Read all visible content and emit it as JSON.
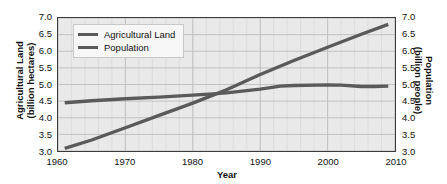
{
  "chart_data": {
    "type": "line",
    "title": "",
    "xlabel": "Year",
    "ylabel": "Agricultural Land\n(billion hectares)",
    "ylabel_left_line1": "Agricultural Land",
    "ylabel_left_line2": "(billion hectares)",
    "ylabel_right_line1": "Population",
    "ylabel_right_line2": "(billion people)",
    "xlim": [
      1960,
      2010
    ],
    "ylim": [
      3.0,
      7.0
    ],
    "ylim_right": [
      3.0,
      7.0
    ],
    "grid": true,
    "legend_position": "top-left",
    "xticks": [
      "1960",
      "1970",
      "1980",
      "1990",
      "2000",
      "2010"
    ],
    "xtick_values": [
      1960,
      1970,
      1980,
      1990,
      2000,
      2010
    ],
    "yticks": [
      "7.0",
      "6.5",
      "6.0",
      "5.5",
      "5.0",
      "4.5",
      "4.0",
      "3.5",
      "3.0"
    ],
    "ytick_values": [
      7.0,
      6.5,
      6.0,
      5.5,
      5.0,
      4.5,
      4.0,
      3.5,
      3.0
    ],
    "yticks_right": [
      "7.0",
      "6.5",
      "6.0",
      "5.5",
      "5.0",
      "4.5",
      "4.0",
      "3.5",
      "3.0"
    ],
    "ytick_right_values": [
      7.0,
      6.5,
      6.0,
      5.5,
      5.0,
      4.5,
      4.0,
      3.5,
      3.0
    ],
    "series": [
      {
        "name": "Agricultural Land",
        "axis": "left",
        "unit": "billion hectares",
        "color": "#5a5a5a",
        "x": [
          1961,
          1965,
          1970,
          1975,
          1980,
          1983,
          1985,
          1990,
          1993,
          1995,
          2000,
          2002,
          2005,
          2007,
          2009
        ],
        "values": [
          4.45,
          4.51,
          4.57,
          4.62,
          4.68,
          4.72,
          4.75,
          4.86,
          4.95,
          4.97,
          4.99,
          4.98,
          4.94,
          4.94,
          4.95
        ]
      },
      {
        "name": "Population",
        "axis": "right",
        "unit": "billion people",
        "color": "#5a5a5a",
        "x": [
          1961,
          1965,
          1970,
          1975,
          1980,
          1983,
          1985,
          1990,
          1995,
          2000,
          2005,
          2009
        ],
        "values": [
          3.08,
          3.33,
          3.7,
          4.07,
          4.44,
          4.68,
          4.84,
          5.3,
          5.72,
          6.12,
          6.51,
          6.81
        ]
      }
    ],
    "annotations": [
      {
        "text": "lines cross near 1983 at ~4.7",
        "x": 1983,
        "y": 4.72
      }
    ]
  },
  "legend": {
    "items": [
      {
        "label": "Agricultural Land",
        "color": "#5a5a5a"
      },
      {
        "label": "Population",
        "color": "#5a5a5a"
      }
    ]
  },
  "colors": {
    "plot_background": "#e9e9e9",
    "axis": "#3a3a3a",
    "grid": "#bdbdbd",
    "grid_minor": "#d5d5d5",
    "line": "#5a5a5a",
    "text": "#111111"
  }
}
